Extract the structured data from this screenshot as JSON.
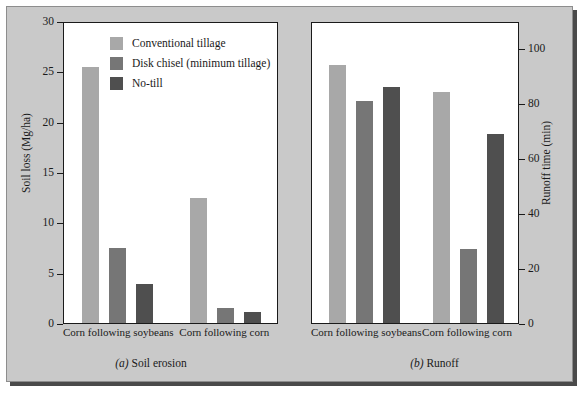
{
  "figure": {
    "background_color": "#c9c9c9",
    "plot_background_color": "#ffffff",
    "axis_color": "#1a1a1a"
  },
  "legend": {
    "items": [
      {
        "label": "Conventional tillage",
        "color": "#a8a8a8"
      },
      {
        "label": "Disk chisel (minimum tillage)",
        "color": "#767676"
      },
      {
        "label": "No-till",
        "color": "#4f4f4f"
      }
    ]
  },
  "panels": [
    {
      "id": "a",
      "caption_index": "(a)",
      "caption_text": "Soil erosion",
      "caption_full": "(a) Soil erosion"
    },
    {
      "id": "b",
      "caption_index": "(b)",
      "caption_text": "Runoff",
      "caption_full": "(b) Runoff"
    }
  ],
  "chart_data": [
    {
      "type": "bar",
      "panel": "a",
      "title": "(a) Soil erosion",
      "xlabel": "",
      "ylabel": "Soil loss (Mg/ha)",
      "ylim": [
        0,
        30
      ],
      "yticks": [
        0,
        5,
        10,
        15,
        20,
        25,
        30
      ],
      "ytick_labels": [
        "0",
        "5",
        "10",
        "15",
        "20",
        "25",
        "30"
      ],
      "y_axis_position": "left",
      "grid": false,
      "legend_position": "inside-top-center",
      "categories": [
        "Corn following soybeans",
        "Corn following corn"
      ],
      "series": [
        {
          "name": "Conventional tillage",
          "color": "#a8a8a8",
          "values": [
            25.4,
            12.4
          ]
        },
        {
          "name": "Disk chisel (minimum tillage)",
          "color": "#767676",
          "values": [
            7.5,
            1.5
          ]
        },
        {
          "name": "No-till",
          "color": "#4f4f4f",
          "values": [
            3.9,
            1.1
          ]
        }
      ]
    },
    {
      "type": "bar",
      "panel": "b",
      "title": "(b) Runoff",
      "xlabel": "",
      "ylabel": "Runoff time (min)",
      "ylim": [
        0,
        110
      ],
      "yticks": [
        0,
        20,
        40,
        60,
        80,
        100
      ],
      "ytick_labels": [
        "0",
        "20",
        "40",
        "60",
        "80",
        "100"
      ],
      "y_axis_position": "right",
      "grid": false,
      "legend_position": "none",
      "categories": [
        "Corn following soybeans",
        "Corn following corn"
      ],
      "series": [
        {
          "name": "Conventional tillage",
          "color": "#a8a8a8",
          "values": [
            94,
            84
          ]
        },
        {
          "name": "Disk chisel (minimum tillage)",
          "color": "#767676",
          "values": [
            81,
            27
          ]
        },
        {
          "name": "No-till",
          "color": "#4f4f4f",
          "values": [
            86,
            69
          ]
        }
      ]
    }
  ]
}
